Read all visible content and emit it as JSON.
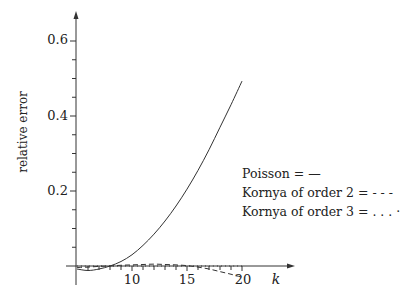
{
  "chart_data": {
    "type": "line",
    "title": "",
    "xlabel": "k",
    "ylabel": "relative error",
    "xlim": [
      5,
      22
    ],
    "ylim": [
      -0.03,
      0.67
    ],
    "x_ticks": [
      10,
      15,
      20
    ],
    "y_ticks": [
      0.2,
      0.4,
      0.6
    ],
    "x_minor_step": 1,
    "y_minor_step": 0.05,
    "grid": false,
    "legend_position": "right-middle",
    "series": [
      {
        "name": "Poisson",
        "style": "solid",
        "legend_text": "Poisson = —",
        "x": [
          5,
          6,
          7,
          8,
          9,
          10,
          11,
          12,
          13,
          14,
          15,
          16,
          17,
          18,
          19,
          20
        ],
        "values": [
          -0.008,
          -0.012,
          -0.008,
          0.0,
          0.012,
          0.03,
          0.055,
          0.085,
          0.12,
          0.16,
          0.205,
          0.255,
          0.31,
          0.37,
          0.43,
          0.493
        ]
      },
      {
        "name": "Kornya of order 2",
        "style": "dashed",
        "legend_text": "Kornya of order 2 = - - -",
        "x": [
          5,
          6,
          7,
          8,
          9,
          10,
          11,
          12,
          13,
          14,
          15,
          16,
          17,
          18,
          19,
          20
        ],
        "values": [
          -0.004,
          -0.003,
          -0.001,
          0.0,
          0.002,
          0.003,
          0.004,
          0.005,
          0.004,
          0.003,
          0.001,
          -0.003,
          -0.008,
          -0.015,
          -0.022,
          -0.03
        ]
      },
      {
        "name": "Kornya of order 3",
        "style": "dotted",
        "legend_text": "Kornya of order 3 = . . . ·",
        "x": [
          5,
          8,
          11,
          14,
          17,
          20
        ],
        "values": [
          0.0,
          0.0,
          0.0,
          0.0,
          0.0,
          0.0
        ]
      }
    ]
  },
  "labels": {
    "y_axis": "relative error",
    "x_axis": "k",
    "y_tick_0": "0.2",
    "y_tick_1": "0.4",
    "y_tick_2": "0.6",
    "x_tick_0": "10",
    "x_tick_1": "15",
    "x_tick_2": "20"
  },
  "legend": [
    {
      "label": "Poisson = —"
    },
    {
      "label": "Kornya of order 2 = - - -"
    },
    {
      "label": "Kornya of order 3 = . . . ·"
    }
  ]
}
